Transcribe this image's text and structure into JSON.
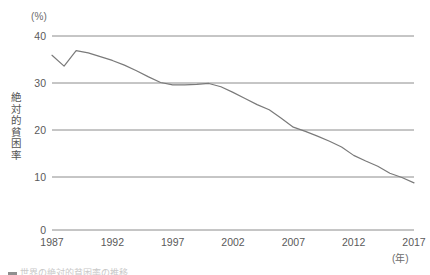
{
  "figure": {
    "y_unit": "(%)",
    "x_unit": "(年)",
    "y_axis_title": "絶対的貧困率",
    "caption_partial": "世界の絶対的貧困率の推移"
  },
  "chart_data": {
    "type": "line",
    "title": "",
    "subtitle": "",
    "xlabel": "(年)",
    "ylabel": "絶対的貧困率",
    "yunit": "(%)",
    "grid": true,
    "legend": "none",
    "line_color": "#7a7a7a",
    "axis_color": "#8c8c8c",
    "xlim": [
      1987,
      2017
    ],
    "ylim": [
      0,
      40
    ],
    "xticks": [
      1987,
      1992,
      1997,
      2002,
      2007,
      2012,
      2017
    ],
    "xtick_labels": [
      "1987",
      "1992",
      "1997",
      "2002",
      "2007",
      "2012",
      "2017"
    ],
    "yticks": [
      0,
      10,
      20,
      30,
      40
    ],
    "ytick_labels": [
      "0",
      "10",
      "20",
      "30",
      "40"
    ],
    "x": [
      1987,
      1988,
      1989,
      1990,
      1991,
      1992,
      1993,
      1994,
      1995,
      1996,
      1997,
      1998,
      1999,
      2000,
      2001,
      2002,
      2003,
      2004,
      2005,
      2006,
      2007,
      2008,
      2009,
      2010,
      2011,
      2012,
      2013,
      2014,
      2015,
      2016,
      2017
    ],
    "values": [
      35.9,
      33.6,
      36.9,
      36.4,
      35.6,
      34.8,
      33.8,
      32.6,
      31.3,
      30.1,
      29.6,
      29.6,
      29.7,
      29.9,
      29.2,
      28.0,
      26.7,
      25.4,
      24.3,
      22.5,
      20.6,
      19.7,
      18.7,
      17.6,
      16.4,
      14.6,
      13.4,
      12.3,
      10.8,
      9.9,
      8.9
    ],
    "series": [
      {
        "name": "絶対的貧困率",
        "values": [
          35.9,
          33.6,
          36.9,
          36.4,
          35.6,
          34.8,
          33.8,
          32.6,
          31.3,
          30.1,
          29.6,
          29.6,
          29.7,
          29.9,
          29.2,
          28.0,
          26.7,
          25.4,
          24.3,
          22.5,
          20.6,
          19.7,
          18.7,
          17.6,
          16.4,
          14.6,
          13.4,
          12.3,
          10.8,
          9.9,
          8.9
        ]
      }
    ]
  }
}
